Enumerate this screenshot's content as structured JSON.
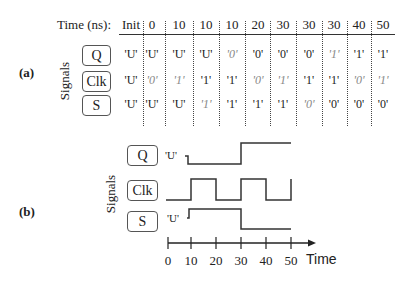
{
  "panel_a": {
    "label": "(a)",
    "header_title": "Time (ns):",
    "columns": [
      "Init",
      "0",
      "10",
      "10",
      "10",
      "20",
      "30",
      "30",
      "30",
      "40",
      "50"
    ],
    "axis_label": "Signals",
    "rows": [
      {
        "signal": "Q",
        "values": [
          "'U'",
          "'U'",
          "'U'",
          "'U'",
          "'0'",
          "'0'",
          "'0'",
          "'0'",
          "'1'",
          "'1'",
          "'1'"
        ],
        "scheduled": [
          false,
          false,
          false,
          false,
          true,
          false,
          false,
          false,
          true,
          false,
          false
        ]
      },
      {
        "signal": "Clk",
        "values": [
          "'U'",
          "'0'",
          "'1'",
          "'1'",
          "'1'",
          "'0'",
          "'1'",
          "'1'",
          "'1'",
          "'0'",
          "'1'"
        ],
        "scheduled": [
          false,
          true,
          true,
          false,
          false,
          true,
          true,
          false,
          false,
          true,
          true
        ]
      },
      {
        "signal": "S",
        "values": [
          "'U'",
          "'U'",
          "'U'",
          "'1'",
          "'1'",
          "'1'",
          "'1'",
          "'0'",
          "'0'",
          "'0'",
          "'0'"
        ],
        "scheduled": [
          false,
          false,
          false,
          true,
          false,
          false,
          false,
          true,
          false,
          false,
          false
        ]
      }
    ]
  },
  "panel_b": {
    "label": "(b)",
    "axis_label": "Signals",
    "x_axis_label": "Time",
    "x_ticks": [
      "0",
      "10",
      "20",
      "30",
      "40",
      "50"
    ],
    "signals": [
      {
        "name": "Q",
        "initial_label": "'U'"
      },
      {
        "name": "Clk",
        "initial_label": ""
      },
      {
        "name": "S",
        "initial_label": "'U'"
      }
    ]
  },
  "chart_data": {
    "type": "line",
    "xlabel": "Time",
    "ylabel": "Signals",
    "x": [
      0,
      10,
      20,
      30,
      40,
      50
    ],
    "series": [
      {
        "name": "Q",
        "values": [
          "U",
          "0",
          "0",
          "1",
          "1",
          "1"
        ]
      },
      {
        "name": "Clk",
        "values": [
          "0",
          "1",
          "0",
          "1",
          "0",
          "1"
        ]
      },
      {
        "name": "S",
        "values": [
          "U",
          "1",
          "1",
          "0",
          "0",
          "0"
        ]
      }
    ]
  }
}
